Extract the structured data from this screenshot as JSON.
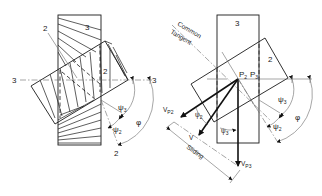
{
  "figure": {
    "left_diagram": {
      "labels": {
        "gear3_top": "3",
        "gear2_leader": "2",
        "gear2_inner": "2",
        "axis_left": "3",
        "axis_right": "3",
        "axis_bottom": "2",
        "psi3": "ψ",
        "psi3_sub": "3",
        "psi2": "ψ",
        "psi2_sub": "2",
        "phi": "φ"
      }
    },
    "right_diagram": {
      "labels": {
        "gear3": "3",
        "gear2": "2",
        "common_tangent_line1": "Common",
        "common_tangent_line2": "Tangent",
        "p2": "P",
        "p2_sub": "2",
        "p3": "P",
        "p3_sub": "3",
        "vp2": "V",
        "vp2_sub": "P2",
        "v": "V",
        "vp3": "V",
        "vp3_sub": "P3",
        "psi2_inner": "ψ",
        "psi2_inner_sub": "2",
        "psi3_inner": "ψ",
        "psi3_inner_sub": "3",
        "psi3": "ψ",
        "psi3_sub": "3",
        "psi2": "ψ",
        "psi2_sub": "2",
        "phi": "φ",
        "sliding": "Sliding"
      }
    }
  }
}
